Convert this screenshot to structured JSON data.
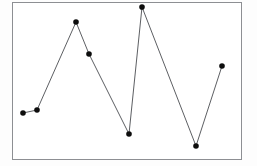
{
  "figure": {
    "name": "line-chart-figure",
    "background_color": "#fdfdfd",
    "width": 257,
    "height": 166
  },
  "frame": {
    "name": "plot-frame",
    "border_color": "#8d8f93",
    "fill_color": "#ffffff",
    "border_width": 1,
    "left": 12,
    "top": 2,
    "right": 241,
    "bottom": 159
  },
  "style": {
    "line_color": "#5d5f63",
    "line_width": 1,
    "marker_color": "#0d0d0d",
    "marker_radius": 2.8
  },
  "chart_data": {
    "type": "line",
    "title": "",
    "subtitle": "",
    "xlabel": "",
    "ylabel": "",
    "grid": false,
    "legend": false,
    "legend_position": "none",
    "marker": "filled-circle",
    "annotations": [],
    "xticks": [],
    "yticks": [],
    "xticklabels": [],
    "yticklabels": [],
    "xlim": [
      0,
      9
    ],
    "ylim": [
      0,
      10
    ],
    "x": [
      1,
      2,
      3,
      4,
      5,
      6,
      7,
      8
    ],
    "values": [
      2.9,
      3.1,
      8.8,
      6.8,
      1.7,
      9.7,
      0.9,
      6.0
    ],
    "series": [
      {
        "name": "series-1",
        "values": [
          2.9,
          3.1,
          8.8,
          6.8,
          1.7,
          9.7,
          0.9,
          6.0
        ],
        "color": "#5d5f63"
      }
    ],
    "points_px": [
      [
        23,
        113
      ],
      [
        37,
        110
      ],
      [
        76,
        22
      ],
      [
        89,
        54
      ],
      [
        129,
        134
      ],
      [
        142,
        7
      ],
      [
        196,
        146
      ],
      [
        222,
        66
      ]
    ]
  }
}
